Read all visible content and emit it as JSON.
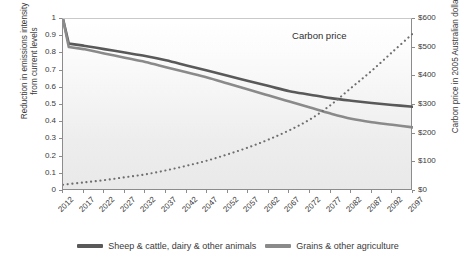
{
  "title": "",
  "axes": {
    "left_title": "Reduction in emissions intensity from current levels",
    "left_title_line1": "Reduction in emissions intensity",
    "left_title_line2": "from current levels",
    "right_title": "Carbon price in 2005 Australian dollars",
    "left_ticks": [
      "1",
      "0.9",
      "0.8",
      "0.7",
      "0.6",
      "0.5",
      "0.4",
      "0.3",
      "0.2",
      "0.1",
      "0"
    ],
    "right_ticks": [
      "$600",
      "$500",
      "$400",
      "$300",
      "$200",
      "$100",
      "$0"
    ],
    "x_ticks": [
      "2012",
      "2017",
      "2022",
      "2027",
      "2032",
      "2037",
      "2042",
      "2047",
      "2052",
      "2057",
      "2062",
      "2067",
      "2072",
      "2077",
      "2082",
      "2087",
      "2092",
      "2097"
    ]
  },
  "annotations": [
    {
      "text": "Carbon price",
      "x_frac": 0.735,
      "y_frac": 0.1
    }
  ],
  "legend": {
    "items": [
      {
        "label": "Sheep & cattle, dairy & other animals",
        "color": "#595959"
      },
      {
        "label": "Grains & other agriculture",
        "color": "#8a8a8a"
      }
    ]
  },
  "colors": {
    "animals": "#595959",
    "grains": "#8a8a8a",
    "carbon_price": "#6e6e6e",
    "axis": "#8c8c8c",
    "text": "#3a3a3a",
    "plot_bg_top": "#ffffff",
    "plot_bg_bottom": "#e9e9e9"
  },
  "chart_data": {
    "type": "line",
    "title": "",
    "xlabel": "",
    "ylabel": "Reduction in emissions intensity from current levels",
    "ylabel_right": "Carbon price in 2005 Australian dollars",
    "x": [
      2012,
      2017,
      2022,
      2027,
      2032,
      2037,
      2042,
      2047,
      2052,
      2057,
      2062,
      2067,
      2072,
      2077,
      2082,
      2087,
      2092,
      2097
    ],
    "xlim": [
      2012,
      2097
    ],
    "ylim": [
      0,
      1
    ],
    "ylim_right": [
      0,
      600
    ],
    "grid": false,
    "legend_position": "bottom",
    "series": [
      {
        "name": "Sheep & cattle, dairy & other animals",
        "axis": "left",
        "color": "#595959",
        "style": "solid",
        "values": [
          1.0,
          0.845,
          0.825,
          0.805,
          0.785,
          0.76,
          0.73,
          0.7,
          0.67,
          0.64,
          0.61,
          0.58,
          0.56,
          0.54,
          0.525,
          0.512,
          0.5,
          0.49
        ]
      },
      {
        "name": "Grains & other agriculture",
        "axis": "left",
        "color": "#8a8a8a",
        "style": "solid",
        "values": [
          1.0,
          0.825,
          0.8,
          0.775,
          0.75,
          0.72,
          0.69,
          0.66,
          0.625,
          0.59,
          0.555,
          0.52,
          0.485,
          0.45,
          0.42,
          0.4,
          0.385,
          0.37
        ]
      },
      {
        "name": "Carbon price",
        "axis": "right",
        "color": "#6e6e6e",
        "style": "dotted",
        "values": [
          22,
          30,
          38,
          48,
          58,
          72,
          88,
          106,
          128,
          152,
          180,
          212,
          250,
          300,
          360,
          420,
          485,
          550
        ]
      }
    ]
  }
}
